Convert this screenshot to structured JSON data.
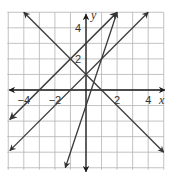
{
  "chart_data": {
    "type": "line",
    "title": "",
    "xlabel": "x",
    "ylabel": "y",
    "xlim": [
      -5,
      5
    ],
    "ylim": [
      -5,
      5
    ],
    "grid": true,
    "grid_step": 1,
    "x_tick_labels": [
      "−4",
      "−2",
      "2",
      "4"
    ],
    "x_tick_values": [
      -4,
      -2,
      2,
      4
    ],
    "y_tick_labels": [
      "2",
      "4"
    ],
    "y_tick_values": [
      2,
      4
    ],
    "series": [
      {
        "name": "line-1",
        "equation": "y = x + 3",
        "slope": 1,
        "intercept": 3,
        "x": [
          -4.9,
          2
        ],
        "y": [
          -1.9,
          5
        ],
        "arrows": "both"
      },
      {
        "name": "line-2",
        "equation": "y = x + 1",
        "slope": 1,
        "intercept": 1,
        "x": [
          -4.9,
          4
        ],
        "y": [
          -3.9,
          5
        ],
        "arrows": "both"
      },
      {
        "name": "line-3",
        "equation": "y = -x + 1",
        "slope": -1,
        "intercept": 1,
        "x": [
          -4,
          5
        ],
        "y": [
          5,
          -4
        ],
        "arrows": "both"
      },
      {
        "name": "line-4",
        "equation": "y = 3x - 1",
        "slope": 3,
        "intercept": -1,
        "x": [
          -1.33,
          2
        ],
        "y": [
          -5,
          5
        ],
        "arrows": "both"
      }
    ]
  },
  "axes": {
    "x_label": "x",
    "y_label": "y",
    "x_ticks": [
      {
        "text": "−4",
        "value": -4
      },
      {
        "text": "−2",
        "value": -2
      },
      {
        "text": "2",
        "value": 2
      },
      {
        "text": "4",
        "value": 4
      }
    ],
    "y_ticks": [
      {
        "text": "2",
        "value": 2
      },
      {
        "text": "4",
        "value": 4
      }
    ]
  },
  "colors": {
    "line": "#3a3a3a",
    "axis": "#1a1a1a",
    "grid": "#b4b4b4",
    "background": "#ffffff"
  }
}
